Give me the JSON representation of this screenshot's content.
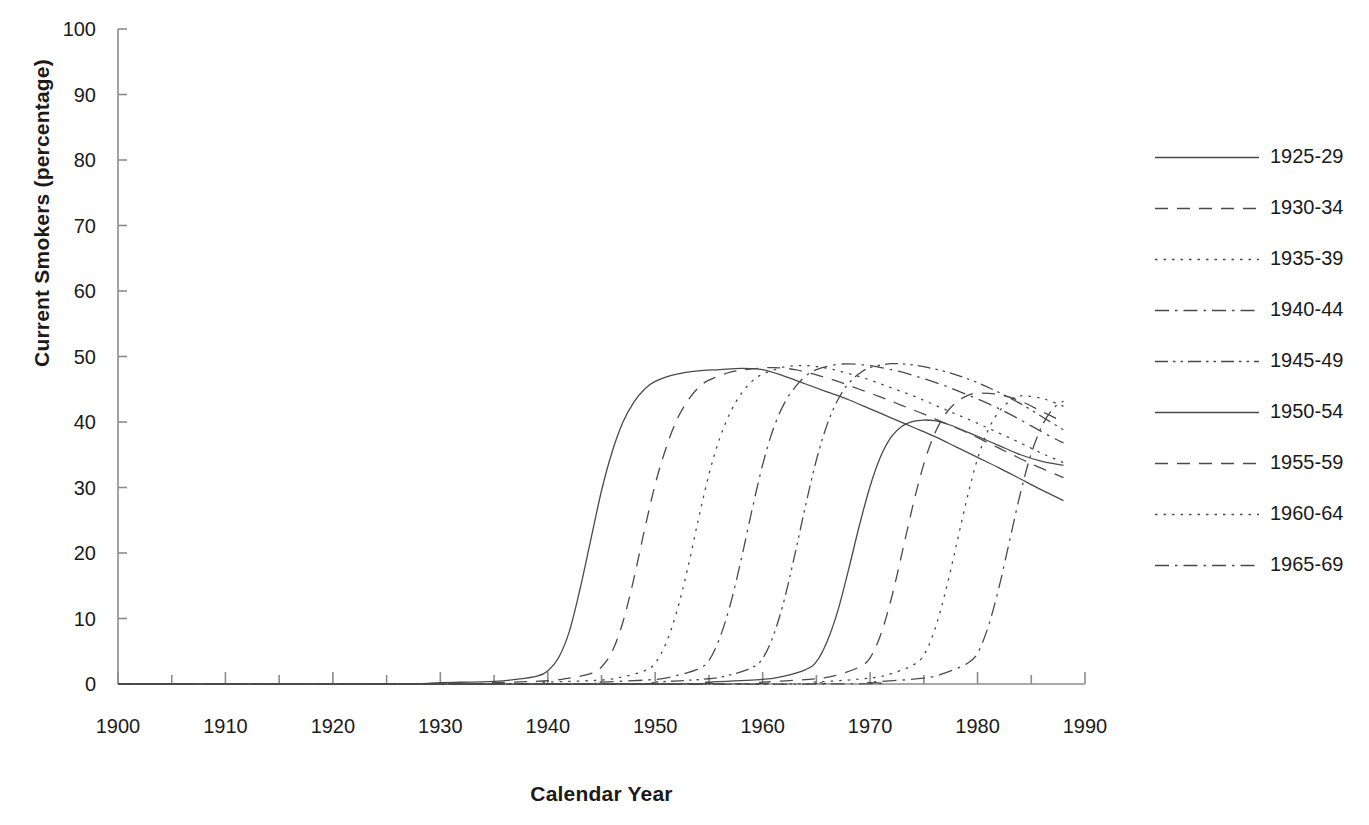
{
  "chart_data": {
    "type": "line",
    "title": "",
    "xlabel": "Calendar Year",
    "ylabel": "Current Smokers (percentage)",
    "xlim": [
      1900,
      1990
    ],
    "ylim": [
      0,
      100
    ],
    "xticks": [
      1900,
      1910,
      1920,
      1930,
      1940,
      1950,
      1960,
      1970,
      1980,
      1990
    ],
    "xtick_labels": [
      "1900",
      "1910",
      "1920",
      "1930",
      "1940",
      "1950",
      "1960",
      "1970",
      "1980",
      "1990"
    ],
    "x_minor_tick_interval": 5,
    "yticks": [
      0,
      10,
      20,
      30,
      40,
      50,
      60,
      70,
      80,
      90,
      100
    ],
    "ytick_labels": [
      "0",
      "10",
      "20",
      "30",
      "40",
      "50",
      "60",
      "70",
      "80",
      "90",
      "100"
    ],
    "grid": false,
    "legend_position": "right",
    "line_color": "#4a4a4a",
    "series": [
      {
        "name": "1925-29",
        "dash": "solid",
        "x": [
          1900,
          1925,
          1930,
          1935,
          1937,
          1939,
          1940,
          1941,
          1942,
          1943,
          1944,
          1945,
          1946,
          1947,
          1948,
          1949,
          1950,
          1952,
          1954,
          1956,
          1958,
          1960,
          1962,
          1964,
          1966,
          1968,
          1970,
          1972,
          1974,
          1976,
          1978,
          1980,
          1982,
          1984,
          1986,
          1988
        ],
        "y": [
          0,
          0,
          0.2,
          0.4,
          0.7,
          1.2,
          2.0,
          4.0,
          8.0,
          14.5,
          22.0,
          29.5,
          35.5,
          40.0,
          43.0,
          45.0,
          46.2,
          47.3,
          47.8,
          48.0,
          48.2,
          48.0,
          47.0,
          45.8,
          44.6,
          43.4,
          42.0,
          40.6,
          39.2,
          37.8,
          36.2,
          34.6,
          33.0,
          31.3,
          29.6,
          28.0
        ]
      },
      {
        "name": "1930-34",
        "dash": "dashed",
        "x": [
          1900,
          1930,
          1935,
          1940,
          1942,
          1944,
          1945,
          1946,
          1947,
          1948,
          1949,
          1950,
          1951,
          1952,
          1953,
          1954,
          1955,
          1957,
          1959,
          1961,
          1963,
          1965,
          1967,
          1969,
          1971,
          1973,
          1975,
          1977,
          1979,
          1981,
          1983,
          1985,
          1987,
          1988
        ],
        "y": [
          0,
          0,
          0.2,
          0.5,
          0.9,
          1.6,
          2.6,
          5.0,
          9.5,
          16.0,
          23.5,
          30.5,
          36.0,
          40.3,
          43.2,
          45.2,
          46.4,
          47.6,
          48.1,
          48.3,
          48.0,
          47.2,
          46.2,
          45.0,
          43.8,
          42.5,
          41.2,
          39.8,
          38.4,
          36.8,
          35.2,
          33.6,
          32.2,
          31.5
        ]
      },
      {
        "name": "1935-39",
        "dash": "dotted",
        "x": [
          1900,
          1935,
          1940,
          1945,
          1947,
          1949,
          1950,
          1951,
          1952,
          1953,
          1954,
          1955,
          1956,
          1957,
          1958,
          1959,
          1960,
          1962,
          1964,
          1966,
          1968,
          1970,
          1972,
          1974,
          1976,
          1978,
          1980,
          1982,
          1984,
          1986,
          1988
        ],
        "y": [
          0,
          0,
          0.3,
          0.6,
          1.1,
          2.0,
          3.2,
          6.2,
          11.0,
          17.5,
          25.0,
          32.0,
          37.5,
          41.5,
          44.3,
          46.2,
          47.3,
          48.4,
          48.6,
          48.2,
          47.4,
          46.4,
          45.2,
          44.0,
          42.6,
          41.2,
          39.8,
          38.3,
          36.8,
          35.2,
          33.8
        ]
      },
      {
        "name": "1940-44",
        "dash": "dashdot",
        "x": [
          1900,
          1940,
          1945,
          1950,
          1952,
          1954,
          1955,
          1956,
          1957,
          1958,
          1959,
          1960,
          1961,
          1962,
          1963,
          1964,
          1965,
          1967,
          1969,
          1971,
          1973,
          1975,
          1977,
          1979,
          1981,
          1983,
          1985,
          1987,
          1988
        ],
        "y": [
          0,
          0,
          0.3,
          0.7,
          1.3,
          2.3,
          3.6,
          7.0,
          12.2,
          19.0,
          26.5,
          33.5,
          39.0,
          42.8,
          45.3,
          47.0,
          48.0,
          48.8,
          48.8,
          48.3,
          47.6,
          46.6,
          45.5,
          44.2,
          42.8,
          41.2,
          39.4,
          37.6,
          36.8
        ]
      },
      {
        "name": "1945-49",
        "dash": "dashdotdot",
        "x": [
          1900,
          1945,
          1950,
          1955,
          1957,
          1959,
          1960,
          1961,
          1962,
          1963,
          1964,
          1965,
          1966,
          1967,
          1968,
          1969,
          1970,
          1972,
          1974,
          1976,
          1978,
          1980,
          1982,
          1984,
          1986,
          1988
        ],
        "y": [
          0,
          0,
          0.3,
          0.8,
          1.4,
          2.5,
          3.9,
          7.4,
          12.8,
          19.8,
          27.3,
          34.2,
          39.6,
          43.4,
          45.9,
          47.4,
          48.3,
          48.9,
          48.7,
          48.1,
          47.2,
          46.0,
          44.5,
          42.8,
          40.8,
          38.8
        ]
      },
      {
        "name": "1950-54",
        "dash": "solid",
        "x": [
          1900,
          1950,
          1955,
          1960,
          1962,
          1964,
          1965,
          1966,
          1967,
          1968,
          1969,
          1970,
          1971,
          1972,
          1973,
          1974,
          1975,
          1976,
          1977,
          1978,
          1980,
          1982,
          1984,
          1986,
          1988
        ],
        "y": [
          0,
          0,
          0.3,
          0.7,
          1.2,
          2.2,
          3.4,
          6.5,
          11.2,
          17.5,
          24.2,
          30.2,
          34.8,
          37.8,
          39.4,
          40.1,
          40.3,
          40.2,
          39.8,
          39.2,
          37.8,
          36.4,
          35.0,
          34.0,
          33.4
        ]
      },
      {
        "name": "1955-59",
        "dash": "dashed",
        "x": [
          1900,
          1955,
          1960,
          1965,
          1967,
          1969,
          1970,
          1971,
          1972,
          1973,
          1974,
          1975,
          1976,
          1977,
          1978,
          1979,
          1980,
          1982,
          1984,
          1986,
          1988
        ],
        "y": [
          0,
          0,
          0.3,
          0.8,
          1.4,
          2.6,
          4.0,
          7.6,
          13.2,
          20.2,
          27.4,
          33.6,
          38.2,
          41.2,
          43.0,
          44.0,
          44.4,
          44.2,
          43.2,
          41.6,
          40.0
        ]
      },
      {
        "name": "1960-64",
        "dash": "dotted",
        "x": [
          1900,
          1960,
          1965,
          1970,
          1972,
          1974,
          1975,
          1976,
          1977,
          1978,
          1979,
          1980,
          1981,
          1982,
          1983,
          1984,
          1986,
          1988
        ],
        "y": [
          0,
          0,
          0.3,
          0.9,
          1.6,
          2.9,
          4.4,
          8.2,
          14.0,
          21.0,
          28.2,
          34.4,
          38.8,
          41.6,
          43.2,
          44.0,
          43.6,
          42.4
        ]
      },
      {
        "name": "1965-69",
        "dash": "dashdot",
        "x": [
          1900,
          1965,
          1970,
          1975,
          1977,
          1979,
          1980,
          1981,
          1982,
          1983,
          1984,
          1985,
          1986,
          1987,
          1988
        ],
        "y": [
          0,
          0,
          0.3,
          0.9,
          1.7,
          3.1,
          4.7,
          8.8,
          14.8,
          22.0,
          29.2,
          35.2,
          39.4,
          42.0,
          43.2
        ]
      }
    ]
  },
  "legend": {
    "items": [
      {
        "label": "1925-29"
      },
      {
        "label": "1930-34"
      },
      {
        "label": "1935-39"
      },
      {
        "label": "1940-44"
      },
      {
        "label": "1945-49"
      },
      {
        "label": "1950-54"
      },
      {
        "label": "1955-59"
      },
      {
        "label": "1960-64"
      },
      {
        "label": "1965-69"
      }
    ]
  }
}
